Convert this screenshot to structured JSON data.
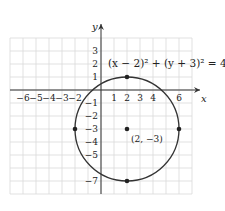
{
  "chart_data": {
    "type": "line",
    "title": "",
    "equation": "(x − 2)² + (y + 3)² = 4²",
    "xlabel": "x",
    "ylabel": "y",
    "xlim": [
      -7,
      7
    ],
    "ylim": [
      -8,
      4
    ],
    "grid": true,
    "x_ticks": [
      "-6",
      "-5",
      "-4",
      "-3",
      "-2",
      "1",
      "2",
      "3",
      "4",
      "6"
    ],
    "y_ticks": [
      "3",
      "2",
      "1",
      "-1",
      "-2",
      "-3",
      "-4",
      "-5",
      "-7"
    ],
    "circle": {
      "center": [
        2,
        -3
      ],
      "radius": 4
    },
    "points": [
      {
        "x": 2,
        "y": -3,
        "label": "(2, −3)"
      },
      {
        "x": 2,
        "y": 1,
        "label": ""
      },
      {
        "x": -2,
        "y": -3,
        "label": ""
      },
      {
        "x": 6,
        "y": -3,
        "label": ""
      },
      {
        "x": 2,
        "y": -7,
        "label": ""
      }
    ]
  },
  "labels": {
    "equation": "(x − 2)² + (y + 3)² = 4²",
    "center_label": "(2, −3)",
    "x_axis": "x",
    "y_axis": "y"
  },
  "colors": {
    "grid": "#d9d9d9",
    "axis": "#333333",
    "curve": "#333333",
    "point": "#222222"
  }
}
